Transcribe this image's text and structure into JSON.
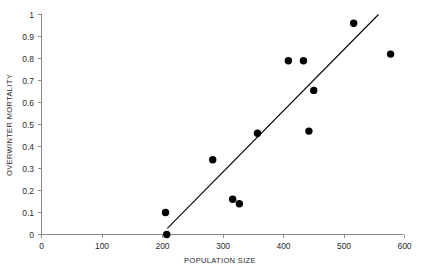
{
  "chart_data": {
    "type": "scatter",
    "title": "",
    "subtitle": "",
    "xlabel": "POPULATION SIZE",
    "ylabel": "OVERWINTER MORTALITY",
    "xlim": [
      0,
      600
    ],
    "ylim": [
      0,
      1
    ],
    "grid": false,
    "legend": null,
    "xticks": [
      0,
      100,
      200,
      300,
      400,
      500,
      600
    ],
    "xtick_labels": [
      "0",
      "100",
      "200",
      "300",
      "400",
      "500",
      "600"
    ],
    "yticks": [
      0,
      0.1,
      0.2,
      0.3,
      0.4,
      0.5,
      0.6,
      0.7,
      0.8,
      0.9,
      1
    ],
    "ytick_labels": [
      "0",
      "0.1",
      "0.2",
      "0.3",
      "0.4",
      "0.5",
      "0.6",
      "0.7",
      "0.8",
      "0.9",
      "1"
    ],
    "marker": "filled-circle",
    "marker_color": "#000000",
    "marker_size_px": 4.6,
    "points": [
      {
        "x": 205,
        "y": 0.1
      },
      {
        "x": 207,
        "y": 0.0
      },
      {
        "x": 283,
        "y": 0.34
      },
      {
        "x": 316,
        "y": 0.16
      },
      {
        "x": 327,
        "y": 0.14
      },
      {
        "x": 357,
        "y": 0.46
      },
      {
        "x": 408,
        "y": 0.79
      },
      {
        "x": 433,
        "y": 0.79
      },
      {
        "x": 442,
        "y": 0.47
      },
      {
        "x": 450,
        "y": 0.655
      },
      {
        "x": 516,
        "y": 0.96
      },
      {
        "x": 577,
        "y": 0.82
      }
    ],
    "trendline": {
      "type": "linear-fit",
      "color": "#000000",
      "x_start": 208,
      "y_start": 0.028,
      "x_end": 557,
      "y_end": 1.0
    },
    "annotations": []
  },
  "axes": {
    "x_axis_name": "population-size-axis",
    "y_axis_name": "overwinter-mortality-axis"
  }
}
